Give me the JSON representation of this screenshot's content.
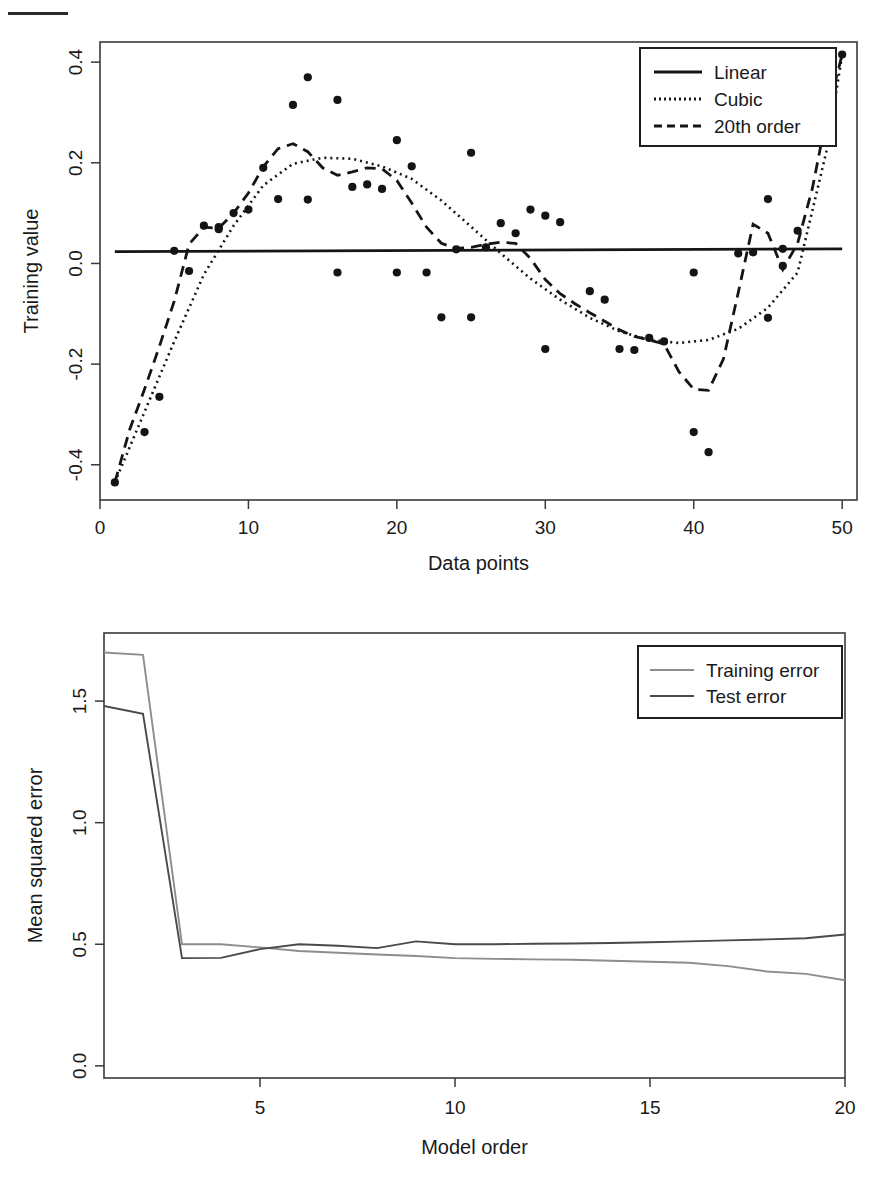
{
  "figure1": {
    "name": "training-value-vs-data-points",
    "xlabel": "Data points",
    "ylabel": "Training value",
    "xticks": [
      "0",
      "10",
      "20",
      "30",
      "40",
      "50"
    ],
    "yticks": [
      "-0.4",
      "-0.2",
      "0.0",
      "0.2",
      "0.4"
    ],
    "legend": [
      {
        "label": "Linear",
        "style": "solid"
      },
      {
        "label": "Cubic",
        "style": "dotted"
      },
      {
        "label": "20th order",
        "style": "dashed"
      }
    ]
  },
  "figure2": {
    "name": "mse-vs-model-order",
    "xlabel": "Model order",
    "ylabel": "Mean squared error",
    "xticks": [
      "5",
      "10",
      "15",
      "20"
    ],
    "yticks": [
      "0.0",
      "0.5",
      "1.0",
      "1.5"
    ],
    "legend": [
      {
        "label": "Training error",
        "style": "solid"
      },
      {
        "label": "Test error",
        "style": "solid"
      }
    ]
  },
  "chart_data": [
    {
      "type": "scatter",
      "title": "",
      "xlabel": "Data points",
      "ylabel": "Training value",
      "xlim": [
        0,
        51
      ],
      "ylim": [
        -0.47,
        0.44
      ],
      "xticks": [
        0,
        10,
        20,
        30,
        40,
        50
      ],
      "yticks": [
        -0.4,
        -0.2,
        0.0,
        0.2,
        0.4
      ],
      "grid": false,
      "legend_position": "top-right",
      "points": {
        "x": [
          1,
          3,
          4,
          5,
          6,
          7,
          8,
          8,
          9,
          10,
          11,
          12,
          13,
          14,
          14,
          16,
          16,
          17,
          18,
          19,
          20,
          20,
          21,
          22,
          23,
          24,
          25,
          25,
          26,
          27,
          28,
          29,
          30,
          30,
          31,
          33,
          34,
          35,
          36,
          37,
          38,
          40,
          40,
          41,
          43,
          44,
          45,
          45,
          46,
          46,
          47,
          50
        ],
        "y": [
          -0.435,
          -0.335,
          -0.265,
          0.025,
          -0.015,
          0.075,
          0.072,
          0.068,
          0.1,
          0.107,
          0.19,
          0.128,
          0.315,
          0.37,
          0.127,
          0.325,
          -0.018,
          0.152,
          0.157,
          0.148,
          0.245,
          -0.018,
          0.193,
          -0.018,
          -0.107,
          0.028,
          0.22,
          -0.107,
          0.032,
          0.08,
          0.06,
          0.107,
          -0.17,
          0.095,
          0.082,
          -0.055,
          -0.072,
          -0.17,
          -0.172,
          -0.148,
          -0.155,
          -0.018,
          -0.335,
          -0.375,
          0.02,
          0.022,
          0.128,
          -0.108,
          0.029,
          -0.005,
          0.065,
          0.415
        ]
      },
      "series": [
        {
          "name": "Linear",
          "style": "solid",
          "x": [
            1,
            50
          ],
          "y": [
            0.0235,
            0.029
          ]
        },
        {
          "name": "Cubic",
          "style": "dotted",
          "x": [
            1,
            3,
            5,
            7,
            9,
            11,
            13,
            15,
            17,
            19,
            21,
            23,
            25,
            27,
            29,
            31,
            33,
            35,
            37,
            39,
            41,
            43,
            45,
            47,
            49,
            50
          ],
          "y": [
            -0.435,
            -0.295,
            -0.155,
            -0.022,
            0.075,
            0.155,
            0.198,
            0.21,
            0.208,
            0.193,
            0.168,
            0.125,
            0.073,
            0.02,
            -0.03,
            -0.072,
            -0.108,
            -0.135,
            -0.152,
            -0.158,
            -0.152,
            -0.13,
            -0.088,
            -0.018,
            0.23,
            0.415
          ]
        },
        {
          "name": "20th order",
          "style": "dashed",
          "x": [
            1,
            2,
            3,
            4,
            5,
            6,
            7,
            8,
            9,
            10,
            11,
            12,
            13,
            14,
            15,
            16,
            17,
            18,
            19,
            20,
            21,
            22,
            23,
            24,
            25,
            26,
            27,
            28,
            29,
            30,
            31,
            32,
            33,
            34,
            35,
            36,
            37,
            38,
            39,
            40,
            41,
            42,
            43,
            44,
            45,
            46,
            47,
            48,
            49,
            50
          ],
          "y": [
            -0.435,
            -0.33,
            -0.25,
            -0.165,
            -0.075,
            0.038,
            0.072,
            0.07,
            0.1,
            0.14,
            0.192,
            0.228,
            0.238,
            0.222,
            0.19,
            0.175,
            0.182,
            0.19,
            0.188,
            0.165,
            0.12,
            0.072,
            0.04,
            0.03,
            0.032,
            0.038,
            0.042,
            0.04,
            0.01,
            -0.032,
            -0.06,
            -0.08,
            -0.098,
            -0.115,
            -0.132,
            -0.145,
            -0.152,
            -0.16,
            -0.215,
            -0.25,
            -0.252,
            -0.19,
            -0.058,
            0.078,
            0.06,
            -0.012,
            0.04,
            0.15,
            0.3,
            0.415
          ]
        }
      ]
    },
    {
      "type": "line",
      "title": "",
      "xlabel": "Model order",
      "ylabel": "Mean squared error",
      "xlim": [
        1,
        20
      ],
      "ylim": [
        -0.05,
        1.78
      ],
      "xticks": [
        5,
        10,
        15,
        20
      ],
      "yticks": [
        0.0,
        0.5,
        1.0,
        1.5
      ],
      "grid": false,
      "legend_position": "top-right",
      "x": [
        1,
        2,
        3,
        4,
        5,
        6,
        7,
        8,
        9,
        10,
        11,
        12,
        13,
        14,
        15,
        16,
        17,
        18,
        19,
        20
      ],
      "series": [
        {
          "name": "Training error",
          "style": "solid",
          "values": [
            1.7,
            1.69,
            0.5,
            0.5,
            0.487,
            0.472,
            0.465,
            0.458,
            0.452,
            0.443,
            0.44,
            0.438,
            0.436,
            0.432,
            0.428,
            0.424,
            0.41,
            0.388,
            0.378,
            0.352
          ]
        },
        {
          "name": "Test error",
          "style": "solid",
          "values": [
            1.48,
            1.448,
            0.443,
            0.444,
            0.48,
            0.5,
            0.494,
            0.484,
            0.512,
            0.5,
            0.5,
            0.502,
            0.503,
            0.505,
            0.508,
            0.512,
            0.516,
            0.52,
            0.525,
            0.54
          ]
        }
      ]
    }
  ]
}
